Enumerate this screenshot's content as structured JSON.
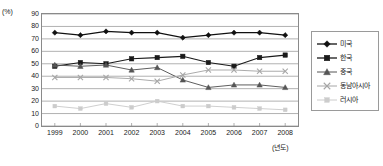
{
  "chart_data": {
    "type": "line",
    "title": "",
    "xlabel": "(년도)",
    "ylabel": "(%)",
    "ylim": [
      0,
      90
    ],
    "ytick_step": 10,
    "yticks": [
      "90",
      "80",
      "70",
      "60",
      "50",
      "40",
      "30",
      "20",
      "10",
      "0"
    ],
    "grid": true,
    "grid_axis": "y",
    "legend_position": "right",
    "categories": [
      "1999",
      "2000",
      "2001",
      "2002",
      "2003",
      "2004",
      "2005",
      "2006",
      "2007",
      "2008"
    ],
    "series": [
      {
        "name": "미국",
        "marker": "diamond",
        "color": "#111111",
        "values": [
          75,
          73,
          76,
          75,
          75,
          71,
          73,
          75,
          75,
          73
        ]
      },
      {
        "name": "한국",
        "marker": "square",
        "color": "#1a1a1a",
        "values": [
          48,
          51,
          50,
          54,
          55,
          56,
          51,
          48,
          55,
          57
        ]
      },
      {
        "name": "중국",
        "marker": "triangle",
        "color": "#555555",
        "values": [
          49,
          48,
          49,
          45,
          47,
          37,
          31,
          33,
          33,
          31
        ]
      },
      {
        "name": "동남아시아",
        "marker": "x",
        "color": "#a6a6a6",
        "values": [
          39,
          39,
          39,
          38,
          36,
          41,
          45,
          45,
          44,
          44
        ]
      },
      {
        "name": "러시아",
        "marker": "small-square",
        "color": "#cccccc",
        "values": [
          16,
          14,
          18,
          15,
          20,
          16,
          16,
          15,
          14,
          13
        ]
      }
    ]
  },
  "axis": {
    "y_unit_label": "(%)",
    "x_unit_label": "(년도)"
  }
}
